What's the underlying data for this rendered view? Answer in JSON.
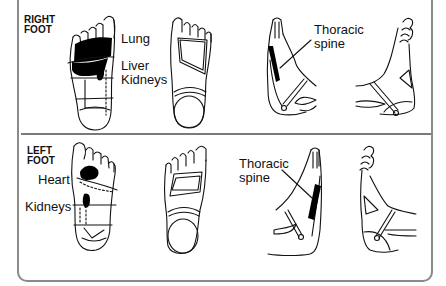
{
  "diagram": {
    "colors": {
      "border": "#8a8a8a",
      "ink": "#111111",
      "fill_zone": "#000000",
      "background": "#ffffff"
    },
    "sections": [
      {
        "id": "right",
        "label_line1": "RIGHT",
        "label_line2": "FOOT",
        "organ_labels": [
          "Lung",
          "Liver",
          "Kidneys"
        ],
        "spine_label_line1": "Thoracic",
        "spine_label_line2": "spine",
        "views": [
          "sole-zones",
          "sole-outline",
          "medial-side",
          "lateral-side"
        ]
      },
      {
        "id": "left",
        "label_line1": "LEFT",
        "label_line2": "FOOT",
        "organ_labels": [
          "Heart",
          "Kidneys"
        ],
        "spine_label_line1": "Thoracic",
        "spine_label_line2": "spine",
        "views": [
          "sole-zones",
          "sole-outline",
          "medial-side",
          "lateral-side"
        ]
      }
    ]
  }
}
